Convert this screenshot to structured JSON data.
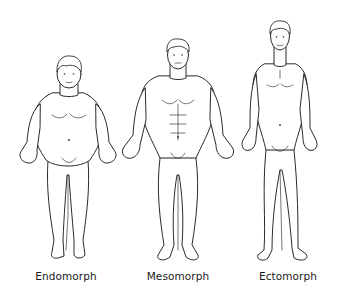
{
  "diagram": {
    "type": "illustration",
    "figures": [
      {
        "id": "endomorph",
        "label": "Endomorph",
        "build": "round, soft, wide"
      },
      {
        "id": "mesomorph",
        "label": "Mesomorph",
        "build": "muscular, broad shoulders"
      },
      {
        "id": "ectomorph",
        "label": "Ectomorph",
        "build": "tall, thin, lean"
      }
    ]
  },
  "colors": {
    "background": "#ffffff",
    "line": "#2a2a2a",
    "text": "#1a1a1a"
  }
}
